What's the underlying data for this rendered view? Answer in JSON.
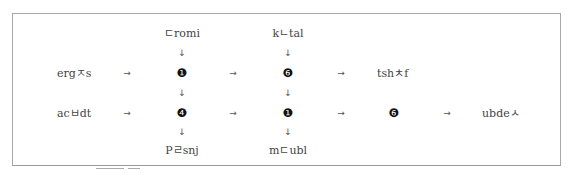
{
  "diagram": {
    "top_labels": [
      "ㄷromi",
      "kㄴtal"
    ],
    "bottom_labels": [
      "Pㄹsnj",
      "mㄷubl"
    ],
    "row1": {
      "source": "ergㅈs",
      "nodes": [
        "❶",
        "❻"
      ],
      "target": "tshㅊf"
    },
    "row2": {
      "source": "acㅂdt",
      "nodes": [
        "❹",
        "❶",
        "❻"
      ],
      "target": "ubdeㅅ"
    },
    "arrow_right": "→",
    "arrow_down": "↓"
  },
  "colors": {
    "border": "#a8a8a8",
    "text": "#444444",
    "node": "#111111"
  }
}
